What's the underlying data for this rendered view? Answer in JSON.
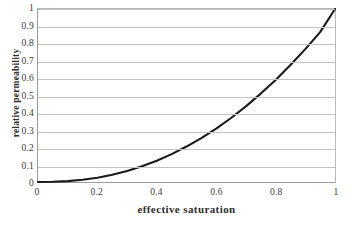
{
  "chart_data": {
    "type": "line",
    "title": "",
    "xlabel": "effective saturation",
    "ylabel": "relative permeability",
    "xlim": [
      0,
      1
    ],
    "ylim": [
      0,
      1
    ],
    "grid": true,
    "legend": "none",
    "line_color": "#1a1a1a",
    "gridline_color": "#c2c2c2",
    "axis_color": "#9a9a9a",
    "background_color": "#ffffff",
    "x_ticks": [
      "0",
      "0.2",
      "0.4",
      "0.6",
      "0.8",
      "1"
    ],
    "x_tick_values": [
      0,
      0.2,
      0.4,
      0.6,
      0.8,
      1
    ],
    "y_ticks": [
      "0",
      "0.1",
      "0.2",
      "0.3",
      "0.4",
      "0.5",
      "0.6",
      "0.7",
      "0.8",
      "0.9",
      "1"
    ],
    "y_tick_values": [
      0,
      0.1,
      0.2,
      0.3,
      0.4,
      0.5,
      0.6,
      0.7,
      0.8,
      0.9,
      1
    ],
    "series": [
      {
        "name": "relative permeability",
        "x": [
          0.0,
          0.05,
          0.1,
          0.15,
          0.2,
          0.25,
          0.3,
          0.35,
          0.4,
          0.45,
          0.5,
          0.55,
          0.6,
          0.65,
          0.7,
          0.75,
          0.8,
          0.85,
          0.9,
          0.95,
          1.0
        ],
        "y": [
          0.0,
          0.001,
          0.005,
          0.013,
          0.025,
          0.042,
          0.064,
          0.091,
          0.123,
          0.161,
          0.205,
          0.254,
          0.309,
          0.37,
          0.437,
          0.511,
          0.59,
          0.676,
          0.768,
          0.866,
          1.0
        ]
      }
    ]
  }
}
